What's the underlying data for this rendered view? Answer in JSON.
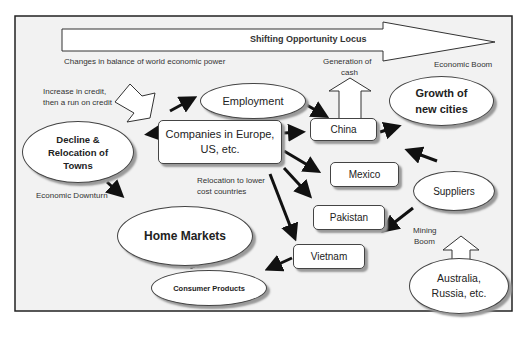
{
  "diagram": {
    "banner": {
      "label": "Shifting Opportunity Locus"
    },
    "annotations": {
      "changes": "Changes in balance of world economic power",
      "credit_line1": "Increase in credit,",
      "credit_line2": "then a run on credit",
      "generation_line1": "Generation of",
      "generation_line2": "cash",
      "economic_boom": "Economic Boom",
      "economic_downturn": "Economic Downturn",
      "relocation_line1": "Relocation to lower",
      "relocation_line2": "cost countries",
      "mining_line1": "Mining",
      "mining_line2": "Boom"
    },
    "nodes": {
      "employment": "Employment",
      "companies_line1": "Companies in Europe,",
      "companies_line2": "US, etc.",
      "decline_line1": "Decline &",
      "decline_line2": "Relocation of",
      "decline_line3": "Towns",
      "china": "China",
      "growth_line1": "Growth of",
      "growth_line2": "new cities",
      "mexico": "Mexico",
      "pakistan": "Pakistan",
      "vietnam": "Vietnam",
      "suppliers": "Suppliers",
      "home_markets": "Home Markets",
      "consumer_products": "Consumer Products",
      "australia_line1": "Australia,",
      "australia_line2": "Russia, etc."
    },
    "colors": {
      "background": "#f2f2f2",
      "border": "#222222",
      "arrow": "#111111",
      "shadow": "#999999"
    }
  }
}
